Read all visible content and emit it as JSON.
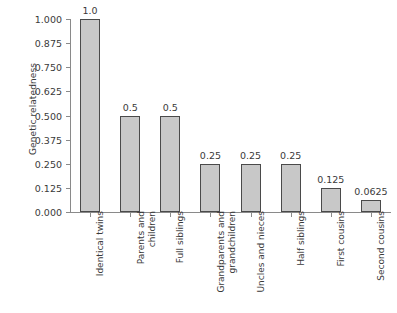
{
  "chart_data": {
    "type": "bar",
    "title": "",
    "xlabel": "",
    "ylabel": "Genetic relatedness",
    "ylim": [
      0,
      1.0
    ],
    "grid": false,
    "legend": false,
    "categories": [
      "Identical twins",
      "Parents and children",
      "Full siblings",
      "Grandparents and grandchildren",
      "Uncles and nieces",
      "Half siblings",
      "First cousins",
      "Second cousins"
    ],
    "category_lines": [
      [
        "Identical twins"
      ],
      [
        "Parents and",
        "children"
      ],
      [
        "Full siblings"
      ],
      [
        "Grandparents and",
        "grandchildren"
      ],
      [
        "Uncles and nieces"
      ],
      [
        "Half siblings"
      ],
      [
        "First cousins"
      ],
      [
        "Second cousins"
      ]
    ],
    "values": [
      1.0,
      0.5,
      0.5,
      0.25,
      0.25,
      0.25,
      0.125,
      0.0625
    ],
    "value_labels": [
      "1.0",
      "0.5",
      "0.5",
      "0.25",
      "0.25",
      "0.25",
      "0.125",
      "0.0625"
    ],
    "y_ticks": [
      0.0,
      0.125,
      0.25,
      0.375,
      0.5,
      0.625,
      0.75,
      0.875,
      1.0
    ],
    "y_tick_labels": [
      "0.000",
      "0.125",
      "0.250",
      "0.375",
      "0.500",
      "0.625",
      "0.750",
      "0.875",
      "1.000"
    ],
    "colors": {
      "bar_fill": "#c8c8c8",
      "bar_border": "#4a4a4a",
      "axis": "#8a8a8a",
      "text": "#3a3a3a",
      "background": "#ffffff"
    }
  }
}
